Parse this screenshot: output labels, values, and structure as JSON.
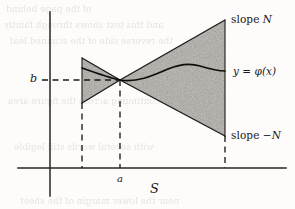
{
  "figure": {
    "caption_region_label": "S"
  },
  "axes": {
    "y_axis_name": "vertical-axis",
    "x_axis_name": "horizontal-axis",
    "y_tick_label": "b",
    "x_tick_label": "a",
    "region_label": "S"
  },
  "annotations": {
    "upper_boundary": {
      "word": "slope",
      "symbol": "N"
    },
    "lower_boundary": {
      "word": "slope",
      "symbol": "−N"
    },
    "solution_curve": {
      "lhs": "y",
      "equals": "=",
      "rhs": "φ(x)"
    }
  },
  "geometry": {
    "apex_x": 120,
    "apex_y": 80,
    "left_edge_x": 82,
    "right_edge_x": 225,
    "x_axis_y": 168,
    "y_axis_x": 50,
    "slope_magnitude": 0.8
  },
  "colors": {
    "ink": "#1a1a1a",
    "shading": "#8f8c87",
    "paper": "#fdfcfa",
    "ghost": "#4a4038"
  },
  "ghost_text": {
    "lines": [
      "of the page behind",
      "and this text shows through faintly",
      "the reverse side of the scanned leaf",
      "continuing across the figure area",
      "with several words still legible",
      "near the lower margin of the sheet"
    ]
  }
}
